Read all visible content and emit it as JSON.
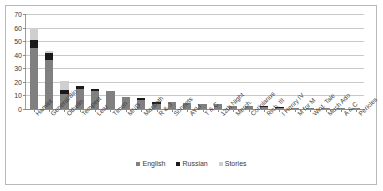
{
  "chart_data": {
    "type": "bar",
    "subtype": "stacked-column",
    "title": "",
    "xlabel": "",
    "ylabel": "",
    "ylim": [
      0,
      70
    ],
    "ytick_step": 10,
    "yticks": [
      70,
      60,
      50,
      40,
      30,
      20,
      10,
      0
    ],
    "grid": true,
    "legend_position": "bottom",
    "categories": [
      "Hamlet",
      "General/Bio",
      "Othello",
      "Tempest",
      "Lear",
      "Timon",
      "MND",
      "Macbeth",
      "R & J",
      "Sonnets",
      "AYLI",
      "T & C",
      "12th Night",
      "Merch.",
      "Coriolanus",
      "Rich. III",
      "I Henry IV",
      "M for M",
      "Wint. Tale",
      "Much Ado",
      "A & C",
      "Pericles"
    ],
    "series": [
      {
        "name": "English",
        "color": "#808080",
        "values": [
          45,
          36,
          11,
          15,
          13,
          13,
          9,
          7,
          4,
          5,
          4.5,
          3.5,
          3.5,
          2.5,
          2.5,
          1.5,
          1,
          0.7,
          0.7,
          0.7,
          0.7,
          0.7
        ]
      },
      {
        "name": "Russian",
        "color": "#1a1a1a",
        "values": [
          6,
          5,
          3,
          2,
          2,
          0,
          0,
          1,
          1.5,
          0,
          0,
          0.5,
          0,
          0,
          0,
          0.5,
          0.5,
          0,
          0,
          0,
          0,
          0
        ]
      },
      {
        "name": "Stories",
        "color": "#cfcfcf",
        "values": [
          9,
          2,
          7,
          0,
          0,
          0,
          0,
          0,
          0,
          0,
          0,
          0,
          0,
          0,
          0,
          0,
          0,
          0,
          0,
          0,
          0,
          0
        ]
      }
    ],
    "totals": [
      60,
      43,
      21,
      17,
      15,
      13,
      9,
      8,
      5.5,
      5,
      4.5,
      4,
      3.5,
      2.5,
      2.5,
      2,
      1.5,
      0.7,
      0.7,
      0.7,
      0.7,
      0.7
    ]
  },
  "legend": {
    "items": [
      {
        "label": "English",
        "color": "#808080"
      },
      {
        "label": "Russian",
        "color": "#1a1a1a"
      },
      {
        "label": "Stories",
        "color": "#cfcfcf"
      }
    ]
  }
}
